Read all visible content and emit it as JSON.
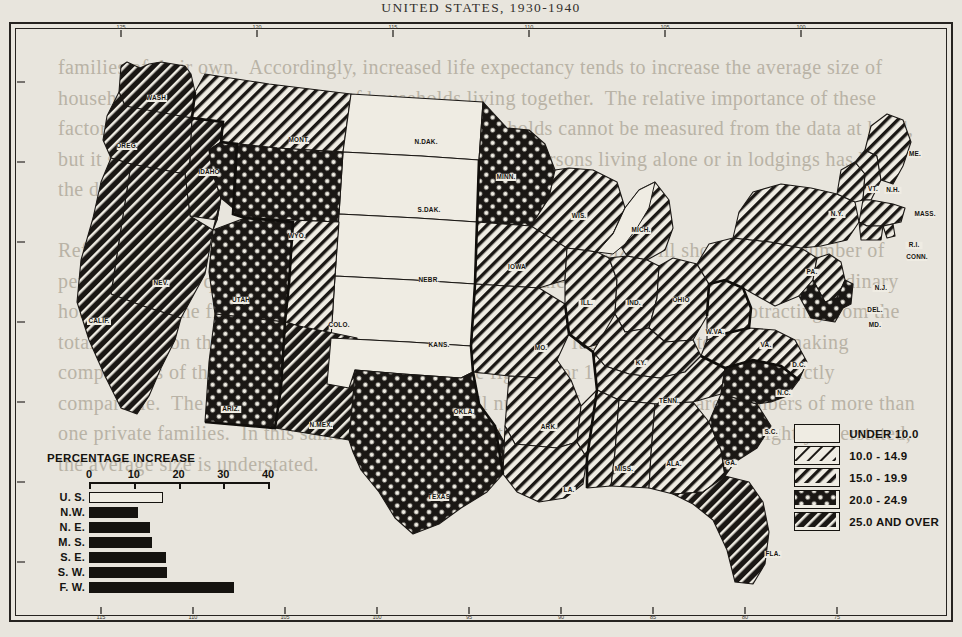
{
  "title": {
    "line": "UNITED STATES, 1930-1940",
    "visible_prefix": "UNITED",
    "visible_suffix": "STATES, 1930-1940"
  },
  "legend": {
    "items": [
      {
        "label": "UNDER 10.0",
        "pattern": "blank"
      },
      {
        "label": "10.0 - 14.9",
        "pattern": "diagonal-thin"
      },
      {
        "label": "15.0 - 19.9",
        "pattern": "diagonal-medium"
      },
      {
        "label": "20.0 - 24.9",
        "pattern": "crosshatch"
      },
      {
        "label": "25.0 AND OVER",
        "pattern": "diagonal-heavy"
      }
    ]
  },
  "inset_chart": {
    "title": "PERCENTAGE INCREASE"
  },
  "chart_data": {
    "type": "bar",
    "orientation": "horizontal",
    "title": "PERCENTAGE INCREASE",
    "xlabel": "",
    "ylabel": "",
    "xlim": [
      0,
      42
    ],
    "ticks": [
      0,
      10,
      20,
      30,
      40
    ],
    "tick_labels": [
      "0",
      "10",
      "20",
      "30",
      "40"
    ],
    "grid": false,
    "categories": [
      "U. S.",
      "N.W.",
      "N. E.",
      "M. S.",
      "S. E.",
      "S. W.",
      "F. W."
    ],
    "values": [
      16.6,
      11.0,
      13.6,
      14.1,
      17.1,
      17.5,
      32.3
    ],
    "styles": [
      "hollow",
      "solid",
      "solid",
      "solid",
      "solid",
      "solid",
      "solid"
    ]
  },
  "map": {
    "projection_note": "conic",
    "meridian_ticks_top": [
      "125",
      "120",
      "115",
      "110",
      "105",
      "100"
    ],
    "meridian_ticks_bottom": [
      "115",
      "110",
      "105",
      "100",
      "95",
      "90",
      "85",
      "80",
      "75"
    ],
    "states": [
      {
        "abbr": "WASH.",
        "class": "diagonal-heavy",
        "x": 148,
        "y": 78
      },
      {
        "abbr": "OREG.",
        "class": "diagonal-heavy",
        "x": 118,
        "y": 126
      },
      {
        "abbr": "IDAHO",
        "class": "diagonal-heavy",
        "x": 200,
        "y": 152
      },
      {
        "abbr": "MONT.",
        "class": "diagonal-medium",
        "x": 290,
        "y": 120
      },
      {
        "abbr": "N.DAK.",
        "class": "blank",
        "x": 417,
        "y": 122
      },
      {
        "abbr": "S.DAK.",
        "class": "blank",
        "x": 420,
        "y": 190
      },
      {
        "abbr": "WYO.",
        "class": "crosshatch",
        "x": 288,
        "y": 216
      },
      {
        "abbr": "NEV.",
        "class": "diagonal-heavy",
        "x": 152,
        "y": 263
      },
      {
        "abbr": "UTAH",
        "class": "crosshatch",
        "x": 232,
        "y": 280
      },
      {
        "abbr": "COLO.",
        "class": "diagonal-medium",
        "x": 330,
        "y": 305
      },
      {
        "abbr": "NEBR.",
        "class": "blank",
        "x": 420,
        "y": 260
      },
      {
        "abbr": "KANS.",
        "class": "blank",
        "x": 430,
        "y": 325
      },
      {
        "abbr": "CALIF.",
        "class": "diagonal-heavy",
        "x": 90,
        "y": 301
      },
      {
        "abbr": "ARIZ.",
        "class": "crosshatch",
        "x": 222,
        "y": 389
      },
      {
        "abbr": "N.MEX.",
        "class": "diagonal-heavy",
        "x": 312,
        "y": 405
      },
      {
        "abbr": "OKLA.",
        "class": "blank",
        "x": 455,
        "y": 392
      },
      {
        "abbr": "TEXAS",
        "class": "crosshatch",
        "x": 430,
        "y": 477
      },
      {
        "abbr": "MINN.",
        "class": "crosshatch",
        "x": 497,
        "y": 157
      },
      {
        "abbr": "IOWA",
        "class": "diagonal-medium",
        "x": 508,
        "y": 247
      },
      {
        "abbr": "MO.",
        "class": "diagonal-medium",
        "x": 532,
        "y": 328
      },
      {
        "abbr": "ARK.",
        "class": "diagonal-medium",
        "x": 540,
        "y": 407
      },
      {
        "abbr": "LA.",
        "class": "diagonal-medium",
        "x": 560,
        "y": 470
      },
      {
        "abbr": "WIS.",
        "class": "diagonal-medium",
        "x": 570,
        "y": 196
      },
      {
        "abbr": "MICH.",
        "class": "diagonal-medium",
        "x": 632,
        "y": 210
      },
      {
        "abbr": "ILL.",
        "class": "diagonal-medium",
        "x": 578,
        "y": 283
      },
      {
        "abbr": "IND.",
        "class": "diagonal-medium",
        "x": 625,
        "y": 283
      },
      {
        "abbr": "OHIO",
        "class": "diagonal-medium",
        "x": 672,
        "y": 280
      },
      {
        "abbr": "KY.",
        "class": "diagonal-medium",
        "x": 632,
        "y": 343
      },
      {
        "abbr": "TENN.",
        "class": "diagonal-medium",
        "x": 660,
        "y": 381
      },
      {
        "abbr": "MISS.",
        "class": "diagonal-medium",
        "x": 615,
        "y": 449
      },
      {
        "abbr": "ALA.",
        "class": "diagonal-medium",
        "x": 665,
        "y": 444
      },
      {
        "abbr": "GA.",
        "class": "diagonal-medium",
        "x": 722,
        "y": 443
      },
      {
        "abbr": "FLA.",
        "class": "diagonal-heavy",
        "x": 764,
        "y": 534
      },
      {
        "abbr": "S.C.",
        "class": "crosshatch",
        "x": 762,
        "y": 412
      },
      {
        "abbr": "N.C.",
        "class": "crosshatch",
        "x": 775,
        "y": 373
      },
      {
        "abbr": "VA.",
        "class": "diagonal-medium",
        "x": 757,
        "y": 325
      },
      {
        "abbr": "W.VA.",
        "class": "diagonal-medium",
        "x": 706,
        "y": 312
      },
      {
        "abbr": "PA.",
        "class": "diagonal-medium",
        "x": 803,
        "y": 252
      },
      {
        "abbr": "N.Y.",
        "class": "diagonal-medium",
        "x": 828,
        "y": 194
      },
      {
        "abbr": "VT.",
        "class": "diagonal-medium",
        "x": 864,
        "y": 169
      },
      {
        "abbr": "N.H.",
        "class": "diagonal-medium",
        "x": 884,
        "y": 170
      },
      {
        "abbr": "ME.",
        "class": "diagonal-medium",
        "x": 906,
        "y": 134
      },
      {
        "abbr": "MASS.",
        "class": "diagonal-medium",
        "x": 916,
        "y": 194
      },
      {
        "abbr": "R.I.",
        "class": "diagonal-medium",
        "x": 905,
        "y": 225
      },
      {
        "abbr": "CONN.",
        "class": "diagonal-medium",
        "x": 908,
        "y": 237
      },
      {
        "abbr": "N.J.",
        "class": "diagonal-medium",
        "x": 872,
        "y": 268
      },
      {
        "abbr": "DEL.",
        "class": "crosshatch",
        "x": 866,
        "y": 290
      },
      {
        "abbr": "MD.",
        "class": "crosshatch",
        "x": 866,
        "y": 305
      },
      {
        "abbr": "D.C.",
        "class": "crosshatch",
        "x": 790,
        "y": 345
      }
    ]
  },
  "bleed_text": "families of their own.  Accordingly, increased life expectancy tends to increase the average size of households as well as the number of households living together.  The relative importance of these factors in determining the trend toward smaller households cannot be measured from the data at hand, but it seems probable that the increase in the number of persons living alone or in lodgings has been the dominant influence.\n\nReference to the table showing the distribution of households by size will show that the number of persons living in quasi-households amounted to the equivalent of a considerable number of ordinary households.  The figures for the total population in households were derived by subtracting from the total population the number of persons in quasi-households.  It should be noted that in making comparisons of the average size of households, the figures for 1930 and 1940 are not strictly comparable.  The totals shown here contain a small number of persons who are members of more than one private families.  In this same degree, while the total number of households is slightly overstated, the average size is understated."
}
